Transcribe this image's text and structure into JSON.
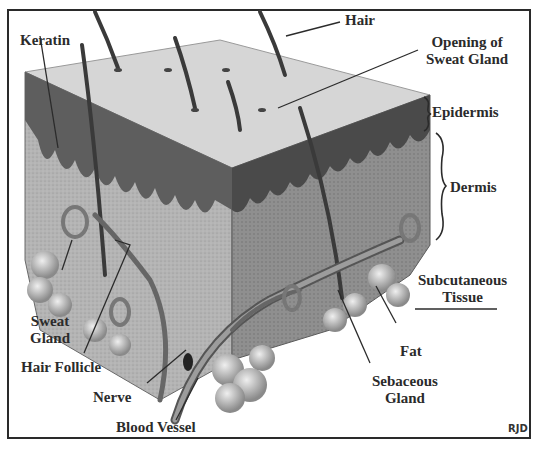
{
  "diagram": {
    "type": "anatomical cross-section",
    "labels": {
      "keratin": "Keratin",
      "hair": "Hair",
      "opening_sweat_gland_1": "Opening of",
      "opening_sweat_gland_2": "Sweat Gland",
      "epidermis": "Epidermis",
      "dermis": "Dermis",
      "subcutaneous_1": "Subcutaneous",
      "subcutaneous_2": "Tissue",
      "sweat_gland_1": "Sweat",
      "sweat_gland_2": "Gland",
      "hair_follicle": "Hair Follicle",
      "nerve": "Nerve",
      "blood_vessel": "Blood Vessel",
      "fat": "Fat",
      "sebaceous_gland_1": "Sebaceous",
      "sebaceous_gland_2": "Gland"
    },
    "signature": "RJD",
    "colors": {
      "ink": "#2b2b2b",
      "surface": "#d9d9d9",
      "epidermis": "#6a6a6a",
      "dermis": "#a8a8a8",
      "fat": "#c4c4c4"
    }
  }
}
